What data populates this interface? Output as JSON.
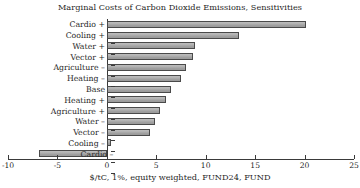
{
  "chart_data": {
    "type": "bar",
    "orientation": "horizontal",
    "title": "Marginal Costs of Carbon Dioxide Emissions, Sensitivities",
    "xlabel": "$/tC, 1%, equity weighted, FUND24, FUND",
    "ylabel": "",
    "xlim": [
      -10,
      25
    ],
    "xticks": [
      -10,
      -5,
      0,
      5,
      10,
      15,
      20,
      25
    ],
    "xtick_labels": [
      "-10",
      "-5",
      "0",
      "5",
      "10",
      "15",
      "20",
      "25"
    ],
    "grid": false,
    "legend": "none",
    "categories": [
      "Cardio +",
      "Cooling +",
      "Water +",
      "Vector +",
      "Agriculture –",
      "Heating –",
      "Base",
      "Heating +",
      "Agriculture +",
      "Water –",
      "Vector –",
      "Cooling –",
      "Cardio –"
    ],
    "values": [
      20.1,
      13.4,
      8.9,
      8.7,
      8.0,
      7.5,
      6.5,
      6.0,
      5.4,
      4.9,
      4.4,
      0.4,
      -6.9
    ],
    "bar_color": "#a9a9a9",
    "bar_edge_color": "#4a4a4a",
    "axis_color": "#3a3a3a"
  },
  "chart": {
    "title": "Marginal Costs of Carbon Dioxide Emissions, Sensitivities",
    "x_caption": "$/tC, 1%, equity weighted, FUND24, FUND"
  }
}
